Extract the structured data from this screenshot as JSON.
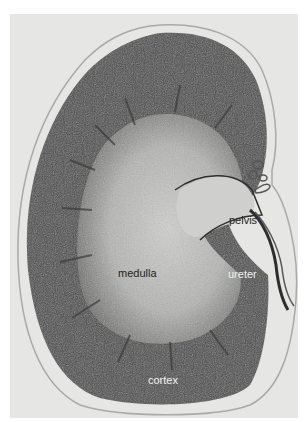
{
  "figure": {
    "labels": {
      "pelvis": "pelvis",
      "medulla": "medulla",
      "ureter": "ureter",
      "cortex": "cortex"
    },
    "colors": {
      "background": "#e6e6e4",
      "cortex": "#4a4a4a",
      "medulla": "#bdbdbb",
      "pelvis": "#cfcfcd",
      "capsule": "#9a9a98"
    }
  }
}
